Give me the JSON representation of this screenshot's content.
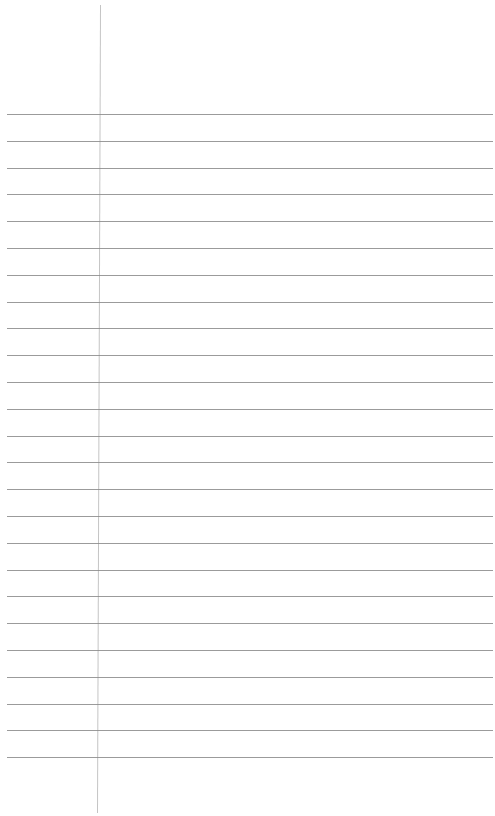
{
  "paper": {
    "type": "ruled-notepaper",
    "background_color": "#ffffff",
    "rule_color": "#8a8a8a",
    "margin_line_color": "#c4c4c4",
    "rule_count": 25,
    "first_rule_y": 114,
    "rule_spacing": 26.8,
    "rule_left": 7,
    "rule_right": 493,
    "margin_line": {
      "x_top": 100,
      "x_bottom": 97,
      "y_top": 5,
      "y_bottom": 813
    },
    "text": ""
  }
}
